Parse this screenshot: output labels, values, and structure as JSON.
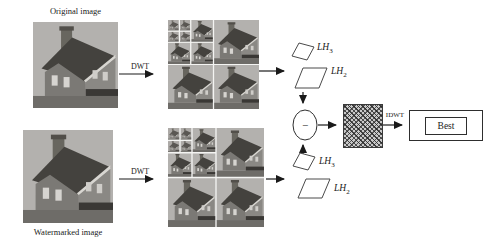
{
  "figure": {
    "title_hint": "DWT watermark extraction flow",
    "nodes": {
      "original_image": {
        "label": "Original image"
      },
      "watermarked_image": {
        "label": "Watermarked image"
      },
      "dwt_top": {
        "label": "DWT"
      },
      "dwt_bottom": {
        "label": "DWT"
      },
      "idwt": {
        "label": "IDWT"
      },
      "best": {
        "label": "Best"
      },
      "subtract": {
        "symbol": "−"
      },
      "lh3_top": {
        "base": "LH",
        "sub": "3"
      },
      "lh2_top": {
        "base": "LH",
        "sub": "2"
      },
      "lh3_bottom": {
        "base": "LH",
        "sub": "3"
      },
      "lh2_bottom": {
        "base": "LH",
        "sub": "2"
      }
    },
    "colors": {
      "line": "#1a1a1a",
      "photo_sky": "#b3b1ae",
      "photo_wall": "#85837f",
      "photo_roof": "#43413d",
      "hatch_dark": "#2f2f2f",
      "hatch_bg": "#c9c9c9",
      "background": "#ffffff"
    }
  }
}
